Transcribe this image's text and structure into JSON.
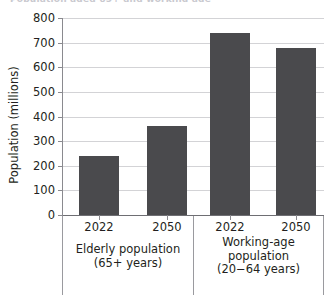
{
  "figure": {
    "title_remnant": "Population aged 65+ and working age",
    "background_color": "#ffffff",
    "bar_color": "#4a4a4d",
    "grid_color": "#d3d3d6",
    "axis_color": "#8a8a8f",
    "text_color": "#231f20"
  },
  "chart_data": {
    "type": "bar",
    "title": "",
    "xlabel": "",
    "ylabel": "Population (millions)",
    "ylim": [
      0,
      800
    ],
    "ytick_labels": [
      "800",
      "700",
      "600",
      "500",
      "400",
      "300",
      "200",
      "100",
      "0"
    ],
    "yticks": [
      800,
      700,
      600,
      500,
      400,
      300,
      200,
      100,
      0
    ],
    "grid": true,
    "legend": "none",
    "categories": [
      "2022",
      "2050",
      "2022",
      "2050"
    ],
    "values": [
      240,
      360,
      740,
      680
    ],
    "groups": [
      {
        "caption_lines": [
          "Elderly population",
          "(65+ years)"
        ],
        "bars": [
          {
            "label": "2022",
            "value": 240
          },
          {
            "label": "2050",
            "value": 360
          }
        ]
      },
      {
        "caption_lines": [
          "Working-age",
          "population",
          "(20−64 years)"
        ],
        "bars": [
          {
            "label": "2022",
            "value": 740
          },
          {
            "label": "2050",
            "value": 680
          }
        ]
      }
    ]
  }
}
